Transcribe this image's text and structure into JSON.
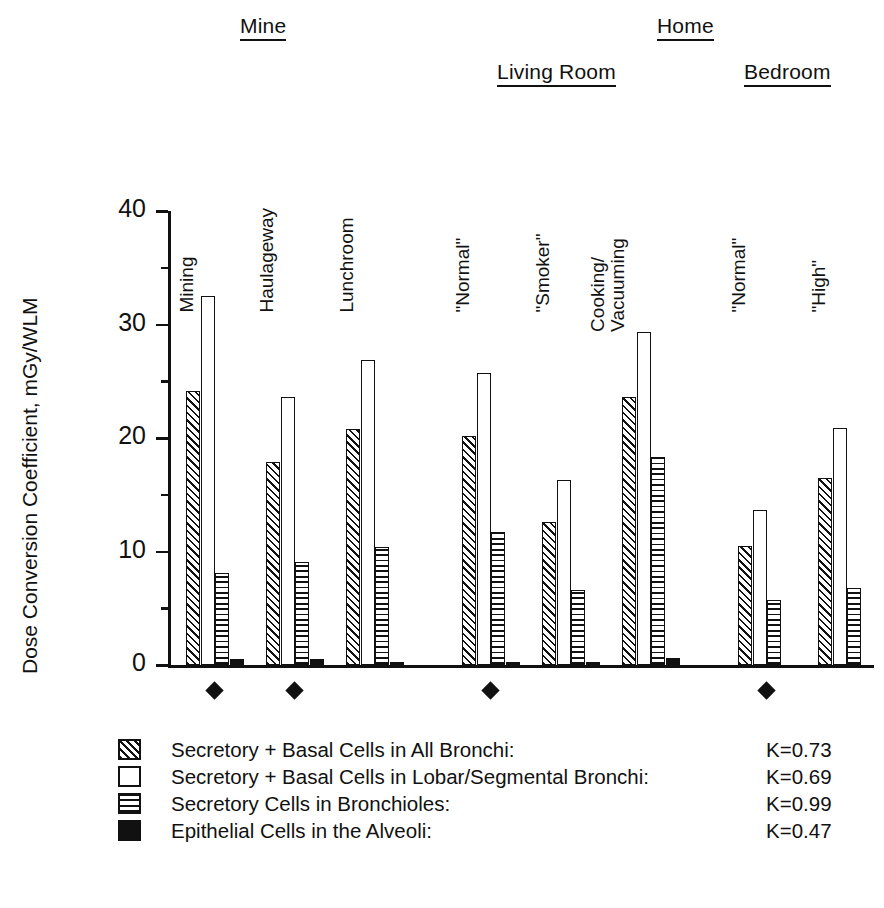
{
  "chart_data": {
    "type": "bar",
    "title": "",
    "xlabel": "",
    "ylabel": "Dose Conversion Coefficient, mGy/WLM",
    "ylim": [
      0,
      40
    ],
    "yticks": [
      0,
      10,
      20,
      30,
      40
    ],
    "ytick_labels": [
      "0",
      "10",
      "20",
      "30",
      "40"
    ],
    "minor_ticks": [
      5,
      15,
      25,
      35
    ],
    "grid": false,
    "legend_position": "below-plot",
    "top_headers": [
      {
        "label": "Mine",
        "underlined": true
      },
      {
        "label": "Home",
        "underlined": true
      }
    ],
    "sub_headers": [
      {
        "label": "Living Room",
        "underlined": true
      },
      {
        "label": "Bedroom",
        "underlined": true
      }
    ],
    "categories": [
      "Mining",
      "Haulageway",
      "Lunchroom",
      "\"Normal\"",
      "\"Smoker\"",
      "Cooking/\nVacuuming",
      "\"Normal\"",
      "\"High\""
    ],
    "category_markers": [
      true,
      true,
      false,
      true,
      false,
      false,
      true,
      false
    ],
    "marker_symbol": "filled-diamond",
    "series": [
      {
        "name": "Secretory + Basal Cells in All Bronchi:",
        "pattern": "diagonal-hatch",
        "k_label": "K=0.73",
        "k_value": 0.73,
        "values": [
          24.1,
          17.9,
          20.8,
          20.2,
          12.6,
          23.6,
          10.5,
          16.5
        ]
      },
      {
        "name": "Secretory + Basal Cells in Lobar/Segmental Bronchi:",
        "pattern": "open",
        "k_label": "K=0.69",
        "k_value": 0.69,
        "values": [
          32.5,
          23.6,
          26.9,
          25.7,
          16.3,
          29.3,
          13.7,
          20.9
        ]
      },
      {
        "name": "Secretory Cells in Bronchioles:",
        "pattern": "horizontal-hatch",
        "k_label": "K=0.99",
        "k_value": 0.99,
        "values": [
          8.1,
          9.1,
          10.4,
          11.7,
          6.6,
          18.3,
          5.7,
          6.8
        ]
      },
      {
        "name": "Epithelial Cells in the Alveoli:",
        "pattern": "solid-black",
        "k_label": "K=0.47",
        "k_value": 0.47,
        "values": [
          0.55,
          0.5,
          0.25,
          0.2,
          0.25,
          0.65,
          0.0,
          0.0
        ]
      }
    ]
  },
  "colors": {
    "ink": "#111111",
    "paper": "#ffffff"
  }
}
